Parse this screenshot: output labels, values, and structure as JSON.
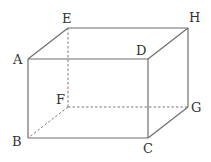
{
  "diagram": {
    "type": "cuboid",
    "vertices": {
      "A": {
        "label": "A",
        "x": 28,
        "y": 59
      },
      "B": {
        "label": "B",
        "x": 28,
        "y": 138
      },
      "C": {
        "label": "C",
        "x": 148,
        "y": 138
      },
      "D": {
        "label": "D",
        "x": 148,
        "y": 59
      },
      "E": {
        "label": "E",
        "x": 68,
        "y": 28
      },
      "F": {
        "label": "F",
        "x": 68,
        "y": 107
      },
      "G": {
        "label": "G",
        "x": 188,
        "y": 107
      },
      "H": {
        "label": "H",
        "x": 188,
        "y": 28
      }
    },
    "visible_edges": [
      "AB",
      "BC",
      "CD",
      "DA",
      "AE",
      "EH",
      "HD",
      "HG",
      "GC"
    ],
    "hidden_edges": [
      "EF",
      "FB",
      "FG"
    ],
    "colors": {
      "edge": "#6e6e6e",
      "hidden_edge": "#7a7a7a",
      "label": "#333333",
      "background": "#ffffff"
    }
  }
}
